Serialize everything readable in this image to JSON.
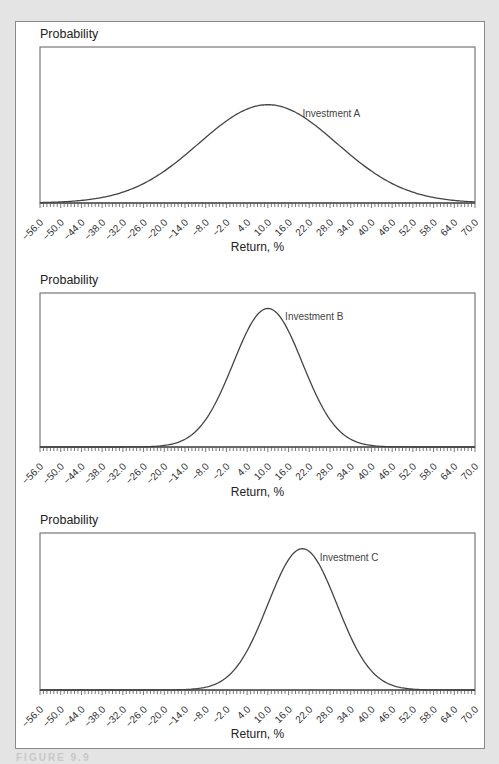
{
  "figure": {
    "caption_partial": "FIGURE 9.9",
    "colors": {
      "background": "#e4e4e4",
      "panel": "#ffffff",
      "curve": "#444444",
      "axis": "#555555",
      "label_text": "#222222"
    }
  },
  "chart_data": [
    {
      "type": "line",
      "title": "",
      "ylabel": "Probability",
      "xlabel": "Return, %",
      "xlim": [
        -56,
        70
      ],
      "x_ticks": [
        "−56.0",
        "−50.0",
        "−44.0",
        "−38.0",
        "−32.0",
        "−26.0",
        "−20.0",
        "−14.0",
        "−8.0",
        "−2.0",
        "4.0",
        "10.0",
        "16.0",
        "22.0",
        "28.0",
        "34.0",
        "40.0",
        "46.0",
        "52.0",
        "58.0",
        "64.0",
        "70.0"
      ],
      "grid": false,
      "series": [
        {
          "name": "Investment A",
          "distribution": "normal",
          "mean": 10,
          "std_dev": 20,
          "peak_x": 10
        }
      ],
      "annotation": {
        "text": "Investment A",
        "x": 20
      }
    },
    {
      "type": "line",
      "title": "",
      "ylabel": "Probability",
      "xlabel": "Return, %",
      "xlim": [
        -56,
        70
      ],
      "x_ticks": [
        "−56.0",
        "−50.0",
        "−44.0",
        "−38.0",
        "−32.0",
        "−26.0",
        "−20.0",
        "−14.0",
        "−8.0",
        "−2.0",
        "4.0",
        "10.0",
        "16.0",
        "22.0",
        "28.0",
        "34.0",
        "40.0",
        "46.0",
        "52.0",
        "58.0",
        "64.0",
        "70.0"
      ],
      "grid": false,
      "series": [
        {
          "name": "Investment B",
          "distribution": "normal",
          "mean": 10,
          "std_dev": 10,
          "peak_x": 10
        }
      ],
      "annotation": {
        "text": "Investment B",
        "x": 15
      }
    },
    {
      "type": "line",
      "title": "",
      "ylabel": "Probability",
      "xlabel": "Return, %",
      "xlim": [
        -56,
        70
      ],
      "x_ticks": [
        "−56.0",
        "−50.0",
        "−44.0",
        "−38.0",
        "−32.0",
        "−26.0",
        "−20.0",
        "−14.0",
        "−8.0",
        "−2.0",
        "4.0",
        "10.0",
        "16.0",
        "22.0",
        "28.0",
        "34.0",
        "40.0",
        "46.0",
        "52.0",
        "58.0",
        "64.0",
        "70.0"
      ],
      "grid": false,
      "series": [
        {
          "name": "Investment C",
          "distribution": "normal",
          "mean": 20,
          "std_dev": 10,
          "peak_x": 20
        }
      ],
      "annotation": {
        "text": "Investment C",
        "x": 25
      }
    }
  ]
}
